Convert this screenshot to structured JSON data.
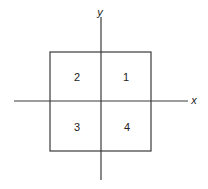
{
  "diagram": {
    "type": "coordinate-quadrants",
    "axes": {
      "x_label": "x",
      "y_label": "y"
    },
    "quadrants": [
      {
        "label": "1",
        "position": "top-right"
      },
      {
        "label": "2",
        "position": "top-left"
      },
      {
        "label": "3",
        "position": "bottom-left"
      },
      {
        "label": "4",
        "position": "bottom-right"
      }
    ],
    "colors": {
      "line": "#3a3a3a",
      "text": "#222222",
      "background": "#ffffff"
    }
  }
}
